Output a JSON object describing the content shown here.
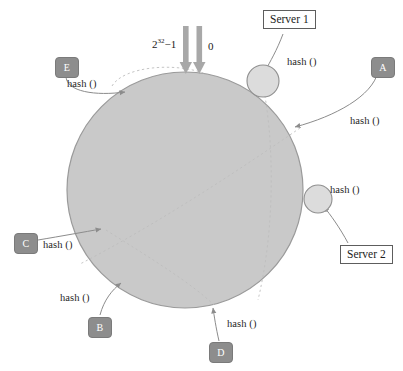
{
  "diagram": {
    "colors": {
      "ring_fill": "#c9c9c9",
      "ring_stroke": "#9a9a9a",
      "node_box_fill": "#8d8d8d",
      "node_box_text": "#ffffff",
      "server_circle_fill": "#dcdcdc",
      "server_circle_stroke": "#8f8f8f",
      "arrow_gray": "#a8a8a8",
      "connector_stroke": "#8c8c8c",
      "dashed_stroke": "#bdbdbd",
      "background": "#ffffff",
      "text": "#1f1f1f"
    },
    "ring": {
      "center_x": 185,
      "center_y": 190,
      "radius": 118,
      "start_label": "0",
      "end_label": "2³²−1",
      "end_label_base": "2",
      "end_label_exponent": "32",
      "end_label_suffix": "−1"
    },
    "top_arrows": [
      {
        "name": "arrow-max-hash",
        "x": 186,
        "label_ref": "end_label"
      },
      {
        "name": "arrow-zero-hash",
        "x": 200,
        "label_ref": "start_label"
      }
    ],
    "key_nodes": [
      {
        "id": "E",
        "label": "E",
        "box_x": 55,
        "box_y": 57,
        "hash_label": "hash ()",
        "hash_x": 67,
        "hash_y": 78,
        "ring_x": 128,
        "ring_y": 90
      },
      {
        "id": "A",
        "label": "A",
        "box_x": 371,
        "box_y": 57,
        "hash_label": "hash ()",
        "hash_x": 350,
        "hash_y": 115,
        "ring_x": 291,
        "ring_y": 128
      },
      {
        "id": "C",
        "label": "C",
        "box_x": 14,
        "box_y": 233,
        "hash_label": "hash ()",
        "hash_x": 43,
        "hash_y": 244,
        "ring_x": 104,
        "ring_y": 228
      },
      {
        "id": "B",
        "label": "B",
        "box_x": 88,
        "box_y": 317,
        "hash_label": "hash ()",
        "hash_x": 60,
        "hash_y": 297,
        "ring_x": 120,
        "ring_y": 281
      },
      {
        "id": "D",
        "label": "D",
        "box_x": 209,
        "box_y": 342,
        "hash_label": "hash ()",
        "hash_x": 227,
        "hash_y": 324,
        "ring_x": 213,
        "ring_y": 305
      }
    ],
    "servers": [
      {
        "id": "server-1",
        "label": "Server 1",
        "box_x": 263,
        "box_y": 10,
        "hash_label": "hash ()",
        "hash_x": 287,
        "hash_y": 62,
        "circle_x": 263,
        "circle_y": 81,
        "circle_r": 16
      },
      {
        "id": "server-2",
        "label": "Server 2",
        "box_x": 340,
        "box_y": 245,
        "hash_label": "hash ()",
        "hash_x": 330,
        "hash_y": 190,
        "circle_x": 318,
        "circle_y": 199,
        "circle_r": 14
      }
    ]
  }
}
